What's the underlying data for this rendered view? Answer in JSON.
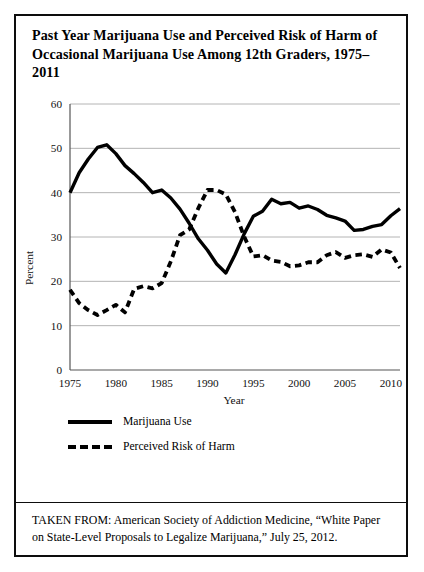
{
  "figure": {
    "title": "Past Year Marijuana Use and Perceived Risk of Harm of Occasional Marijuana Use Among 12th Graders, 1975–2011",
    "source_note": "TAKEN FROM: American Society of Addiction Medicine, “White Paper on State-Level Proposals to Legalize Marijuana,” July 25, 2012."
  },
  "legend": {
    "entries": [
      {
        "label": "Marijuana Use",
        "style": "solid",
        "color": "#000000"
      },
      {
        "label": "Perceived Risk of Harm",
        "style": "dashed",
        "color": "#000000"
      }
    ]
  },
  "chart_data": {
    "type": "line",
    "title": "",
    "xlabel": "Year",
    "ylabel": "Percent",
    "xlim": [
      1975,
      2011
    ],
    "ylim": [
      0,
      60
    ],
    "ytick_step": 10,
    "yticks": [
      0,
      10,
      20,
      30,
      40,
      50,
      60
    ],
    "xticks": [
      1975,
      1980,
      1985,
      1990,
      1995,
      2000,
      2005,
      2010
    ],
    "grid": "horizontal",
    "legend_position": "below-plot-left",
    "gridline_color": "#b4b4b4",
    "axis_color": "#555555",
    "x": [
      1975,
      1976,
      1977,
      1978,
      1979,
      1980,
      1981,
      1982,
      1983,
      1984,
      1985,
      1986,
      1987,
      1988,
      1989,
      1990,
      1991,
      1992,
      1993,
      1994,
      1995,
      1996,
      1997,
      1998,
      1999,
      2000,
      2001,
      2002,
      2003,
      2004,
      2005,
      2006,
      2007,
      2008,
      2009,
      2010,
      2011
    ],
    "series": [
      {
        "name": "Marijuana Use",
        "style": "solid",
        "color": "#000000",
        "values": [
          40.0,
          44.5,
          47.6,
          50.2,
          50.8,
          48.8,
          46.1,
          44.3,
          42.3,
          40.0,
          40.6,
          38.8,
          36.3,
          33.1,
          29.6,
          27.0,
          23.9,
          21.9,
          26.0,
          30.7,
          34.7,
          35.8,
          38.5,
          37.5,
          37.8,
          36.5,
          37.0,
          36.2,
          34.9,
          34.3,
          33.6,
          31.5,
          31.7,
          32.4,
          32.8,
          34.8,
          36.4
        ]
      },
      {
        "name": "Perceived Risk of Harm",
        "style": "dashed",
        "color": "#000000",
        "values": [
          18.1,
          15.1,
          13.5,
          12.4,
          13.5,
          14.7,
          13.0,
          18.3,
          18.9,
          18.4,
          19.6,
          24.5,
          30.4,
          31.7,
          36.5,
          40.6,
          40.6,
          39.6,
          35.6,
          30.1,
          25.6,
          25.9,
          24.7,
          24.4,
          23.4,
          23.6,
          24.3,
          24.3,
          25.9,
          26.6,
          25.3,
          25.9,
          26.1,
          25.5,
          27.2,
          26.5,
          23.0
        ]
      }
    ]
  }
}
